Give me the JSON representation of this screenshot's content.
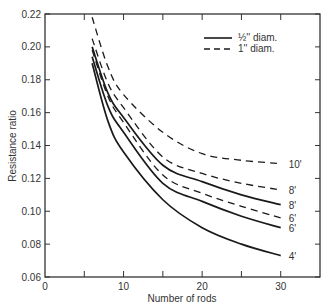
{
  "chart_data": {
    "type": "line",
    "title": "",
    "xlabel": "Number of rods",
    "ylabel": "Resistance ratio",
    "xlim": [
      0,
      35
    ],
    "ylim": [
      0.06,
      0.22
    ],
    "x_ticks": [
      0,
      10,
      20,
      30
    ],
    "x_minor_ticks": [
      5,
      15,
      25
    ],
    "y_ticks": [
      0.06,
      0.08,
      0.1,
      0.12,
      0.14,
      0.16,
      0.18,
      0.2,
      0.22
    ],
    "y_tick_labels": [
      "0.06",
      "0.08",
      "0.10",
      "0.12",
      "0.14",
      "0.16",
      "0.18",
      "0.20",
      "0.22"
    ],
    "x_tick_labels": [
      "0",
      "10",
      "20",
      "30"
    ],
    "grid": false,
    "legend": {
      "position": "upper right",
      "entries": [
        {
          "label": "½'' diam.",
          "style": "solid"
        },
        {
          "label": "1'' diam.",
          "style": "dashed"
        }
      ]
    },
    "x": [
      6,
      8,
      10,
      15,
      20,
      25,
      30
    ],
    "series": [
      {
        "name": "10' (1'' diam.)",
        "label": "10'",
        "style": "dashed",
        "values": [
          0.218,
          0.188,
          0.171,
          0.148,
          0.135,
          0.131,
          0.129
        ]
      },
      {
        "name": "8' (1'' diam.)",
        "label": "8'",
        "style": "dashed",
        "values": [
          0.205,
          0.178,
          0.163,
          0.133,
          0.123,
          0.117,
          0.113
        ]
      },
      {
        "name": "8' (½'' diam.)",
        "label": "8'",
        "style": "solid",
        "values": [
          0.2,
          0.172,
          0.157,
          0.128,
          0.118,
          0.11,
          0.104
        ]
      },
      {
        "name": "6' (1'' diam.)",
        "label": "6'",
        "style": "dashed",
        "values": [
          0.198,
          0.17,
          0.154,
          0.122,
          0.111,
          0.103,
          0.096
        ]
      },
      {
        "name": "6' (½'' diam.)",
        "label": "6'",
        "style": "solid",
        "values": [
          0.194,
          0.164,
          0.148,
          0.117,
          0.106,
          0.097,
          0.09
        ]
      },
      {
        "name": "4' (½'' diam.)",
        "label": "4'",
        "style": "solid",
        "values": [
          0.19,
          0.155,
          0.136,
          0.107,
          0.09,
          0.08,
          0.073
        ]
      }
    ]
  },
  "axes": {
    "xlabel": "Number of rods",
    "ylabel": "Resistance ratio"
  },
  "legend": {
    "solid_label": "½'' diam.",
    "dashed_label": "1'' diam."
  },
  "colors": {
    "line": "#1a1a1a",
    "axis": "#333333",
    "background": "#ffffff"
  }
}
